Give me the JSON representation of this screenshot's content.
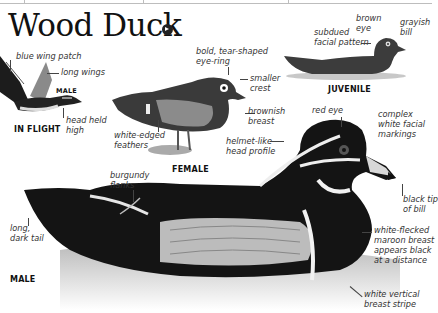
{
  "title": "Wood Duck",
  "audio_icon": "speaker-icon",
  "figures": {
    "in_flight": {
      "caption": "IN FLIGHT",
      "sex": "MALE",
      "labels": [
        "blue wing patch",
        "long wings",
        "head held high"
      ]
    },
    "female": {
      "caption": "FEMALE",
      "labels": [
        "bold, tear-shaped eye-ring",
        "smaller crest",
        "brownish breast",
        "white-edged feathers"
      ]
    },
    "juvenile": {
      "caption": "JUVENILE",
      "labels": [
        "subdued facial pattern",
        "brown eye",
        "grayish bill"
      ]
    },
    "male": {
      "caption": "MALE",
      "labels": [
        "red eye",
        "complex white facial markings",
        "helmet-like head profile",
        "burgundy flanks",
        "long, dark tail",
        "black tip of bill",
        "white-flecked maroon breast appears black at a distance",
        "white vertical breast stripe"
      ]
    }
  },
  "text": {
    "blue_wing_patch": "blue wing patch",
    "long_wings": "long wings",
    "male_small": "MALE",
    "head_held_1": "head held",
    "head_held_2": "high",
    "in_flight": "IN FLIGHT",
    "eye_ring_1": "bold, tear-shaped",
    "eye_ring_2": "eye-ring",
    "smaller_1": "smaller",
    "smaller_2": "crest",
    "brownish_1": "brownish",
    "brownish_2": "breast",
    "white_edged_1": "white-edged",
    "white_edged_2": "feathers",
    "female": "FEMALE",
    "subdued_1": "subdued",
    "subdued_2": "facial pattern",
    "brown_eye_1": "brown",
    "brown_eye_2": "eye",
    "grayish_1": "grayish",
    "grayish_2": "bill",
    "juvenile": "JUVENILE",
    "red_eye": "red eye",
    "complex_1": "complex",
    "complex_2": "white facial",
    "complex_3": "markings",
    "helmet_1": "helmet-like",
    "helmet_2": "head profile",
    "burgundy_1": "burgundy",
    "burgundy_2": "flanks",
    "tail_1": "long,",
    "tail_2": "dark tail",
    "black_tip_1": "black tip",
    "black_tip_2": "of bill",
    "flecked_1": "white-flecked",
    "flecked_2": "maroon breast",
    "flecked_3": "appears black",
    "flecked_4": "at a distance",
    "stripe_1": "white vertical",
    "stripe_2": "breast stripe",
    "male_big": "MALE"
  }
}
